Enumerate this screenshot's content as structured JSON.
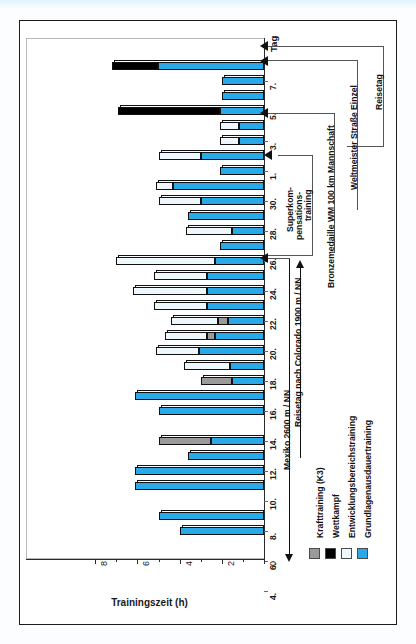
{
  "chart_data": {
    "type": "bar",
    "orientation": "horizontal-rotated",
    "title": "",
    "xlabel": "Trainingszeit (h)",
    "ylabel": "Tag",
    "xlim": [
      0,
      8
    ],
    "xticks": [
      "0",
      "2",
      "4",
      "6",
      "8"
    ],
    "grid": false,
    "legend_position": "bottom-right",
    "stacked": true,
    "series": [
      {
        "name": "Krafttraining (K3)",
        "color": "#9a9a9a"
      },
      {
        "name": "Wettkampf",
        "color": "#000000"
      },
      {
        "name": "Entwicklungsbereichstraining",
        "color": "#eef7fb"
      },
      {
        "name": "Grundlagenausdauertraining",
        "color": "#29a9e8"
      }
    ],
    "categories": [
      "8.",
      "7.",
      "6.",
      "5.",
      "4.",
      "3.",
      "2.",
      "1.",
      "31.",
      "30.",
      "29.",
      "28.",
      "27.",
      "26.",
      "25.",
      "24.",
      "23.",
      "22.",
      "21.",
      "20.",
      "19.",
      "18.",
      "17.",
      "16.",
      "15.",
      "14.",
      "13.",
      "12.",
      "11.",
      "10.",
      "9.",
      "8.",
      "7.",
      "6.",
      "5.",
      "4."
    ],
    "tick_labels": [
      "7.",
      "5.",
      "3.",
      "1.",
      "30.",
      "28.",
      "26.",
      "24.",
      "22.",
      "20.",
      "18.",
      "16.",
      "14.",
      "12.",
      "10.",
      "8.",
      "6.",
      "4."
    ],
    "bars": [
      {
        "day": "8.",
        "grundlagen": 5.0,
        "entwicklung": 0,
        "kraft": 0,
        "wettkampf": 2.2
      },
      {
        "day": "7.",
        "grundlagen": 2.0,
        "entwicklung": 0,
        "kraft": 0,
        "wettkampf": 0
      },
      {
        "day": "6.",
        "grundlagen": 2.0,
        "entwicklung": 0,
        "kraft": 0,
        "wettkampf": 0
      },
      {
        "day": "5.",
        "grundlagen": 2.1,
        "entwicklung": 0,
        "kraft": 0,
        "wettkampf": 4.8
      },
      {
        "day": "4.",
        "grundlagen": 1.2,
        "entwicklung": 0.9,
        "kraft": 0,
        "wettkampf": 0
      },
      {
        "day": "3.",
        "grundlagen": 1.2,
        "entwicklung": 0.9,
        "kraft": 0,
        "wettkampf": 0
      },
      {
        "day": "2.",
        "grundlagen": 3.0,
        "entwicklung": 2.0,
        "kraft": 0,
        "wettkampf": 0
      },
      {
        "day": "1.",
        "grundlagen": 2.1,
        "entwicklung": 0,
        "kraft": 0,
        "wettkampf": 0
      },
      {
        "day": "31.",
        "grundlagen": 4.3,
        "entwicklung": 0.8,
        "kraft": 0,
        "wettkampf": 0
      },
      {
        "day": "30.",
        "grundlagen": 3.0,
        "entwicklung": 2.0,
        "kraft": 0,
        "wettkampf": 0
      },
      {
        "day": "29.",
        "grundlagen": 3.6,
        "entwicklung": 0,
        "kraft": 0,
        "wettkampf": 0
      },
      {
        "day": "28.",
        "grundlagen": 1.5,
        "entwicklung": 2.2,
        "kraft": 0,
        "wettkampf": 0
      },
      {
        "day": "27.",
        "grundlagen": 2.1,
        "entwicklung": 0,
        "kraft": 0,
        "wettkampf": 0
      },
      {
        "day": "26.",
        "grundlagen": 2.3,
        "entwicklung": 4.7,
        "kraft": 0,
        "wettkampf": 0
      },
      {
        "day": "25.",
        "grundlagen": 2.7,
        "entwicklung": 2.5,
        "kraft": 0,
        "wettkampf": 0
      },
      {
        "day": "24.",
        "grundlagen": 2.7,
        "entwicklung": 3.5,
        "kraft": 0,
        "wettkampf": 0
      },
      {
        "day": "23.",
        "grundlagen": 2.7,
        "entwicklung": 2.5,
        "kraft": 0,
        "wettkampf": 0
      },
      {
        "day": "22.",
        "grundlagen": 1.7,
        "entwicklung": 2.2,
        "kraft": 0.5,
        "wettkampf": 0
      },
      {
        "day": "21.",
        "grundlagen": 2.3,
        "entwicklung": 2.0,
        "kraft": 0.4,
        "wettkampf": 0
      },
      {
        "day": "20.",
        "grundlagen": 3.1,
        "entwicklung": 2.0,
        "kraft": 0,
        "wettkampf": 0
      },
      {
        "day": "19.",
        "grundlagen": 1.6,
        "entwicklung": 2.2,
        "kraft": 0,
        "wettkampf": 0
      },
      {
        "day": "18.",
        "grundlagen": 1.5,
        "entwicklung": 0,
        "kraft": 1.5,
        "wettkampf": 0
      },
      {
        "day": "17.",
        "grundlagen": 6.1,
        "entwicklung": 0,
        "kraft": 0,
        "wettkampf": 0
      },
      {
        "day": "16.",
        "grundlagen": 5.0,
        "entwicklung": 0,
        "kraft": 0,
        "wettkampf": 0
      },
      {
        "day": "15.",
        "grundlagen": 0,
        "entwicklung": 0,
        "kraft": 0,
        "wettkampf": 0
      },
      {
        "day": "14.",
        "grundlagen": 2.5,
        "entwicklung": 0,
        "kraft": 2.5,
        "wettkampf": 0
      },
      {
        "day": "13.",
        "grundlagen": 3.6,
        "entwicklung": 0,
        "kraft": 0,
        "wettkampf": 0
      },
      {
        "day": "12.",
        "grundlagen": 6.1,
        "entwicklung": 0,
        "kraft": 0,
        "wettkampf": 0
      },
      {
        "day": "11.",
        "grundlagen": 6.1,
        "entwicklung": 0,
        "kraft": 0,
        "wettkampf": 0
      },
      {
        "day": "10.",
        "grundlagen": 0,
        "entwicklung": 0,
        "kraft": 0,
        "wettkampf": 0
      },
      {
        "day": "9.",
        "grundlagen": 5.0,
        "entwicklung": 0,
        "kraft": 0,
        "wettkampf": 0
      },
      {
        "day": "8.",
        "grundlagen": 4.0,
        "entwicklung": 0,
        "kraft": 0,
        "wettkampf": 0
      }
    ],
    "annotations": [
      "Superkompensations-training",
      "Bronzemedaille WM 100 km Mannschaft",
      "Weltmeister Straße Einzel",
      "Reisetag",
      "Reisetag nach Colorado 1900 m / NN",
      "Mexiko 2600 m / NN"
    ]
  },
  "axis": {
    "y_caption": "Tag",
    "x_title": "Trainingszeit (h)",
    "xticks": [
      "8",
      "6",
      "4",
      "2",
      "0"
    ],
    "day_labels": [
      "7.",
      "5.",
      "3.",
      "1.",
      "30.",
      "28.",
      "26.",
      "24.",
      "22.",
      "20.",
      "18.",
      "16.",
      "14.",
      "12.",
      "10.",
      "8.",
      "6.",
      "4."
    ]
  },
  "annotations": {
    "superkomp_line1": "Superkom-",
    "superkomp_line2": "pensations-",
    "superkomp_line3": "training",
    "bronze": "Bronzemedaille WM 100 km Mannschaft",
    "weltmeister": "Weltmeister Straße Einzel",
    "reisetag": "Reisetag",
    "colorado": "Reisetag nach Colorado 1900 m / NN",
    "mexiko": "Mexiko 2600 m / NN"
  },
  "legend": {
    "items": [
      {
        "label": "Krafttraining (K3)",
        "color": "#9a9a9a"
      },
      {
        "label": "Wettkampf",
        "color": "#000000"
      },
      {
        "label": "Entwicklungsbereichstraining",
        "color": "#eef7fb"
      },
      {
        "label": "Grundlagenausdauertraining",
        "color": "#29a9e8"
      }
    ]
  }
}
